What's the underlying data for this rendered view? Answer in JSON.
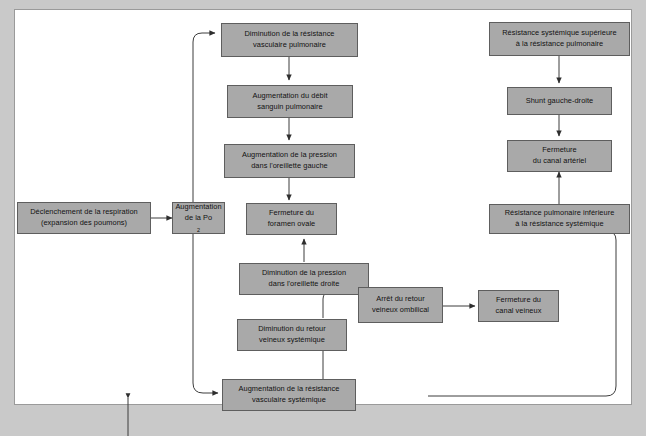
{
  "diagram": {
    "background_color": "#c9c9c9",
    "page_color": "#ffffff",
    "node_fill": "#a9a9a9",
    "node_border": "#5e5e5e",
    "line_color": "#3c3c3c",
    "nodes": [
      {
        "id": "declenchement",
        "line1": "Déclenchement de la respiration",
        "line2": "(expansion des poumons)"
      },
      {
        "id": "augmentation-po2",
        "line1": "Augmentation",
        "line2": "de la Po",
        "sub": "2"
      },
      {
        "id": "diminution-resistance-vasc-pulm",
        "line1": "Diminution de la résistance",
        "line2": "vasculaire pulmonaire"
      },
      {
        "id": "augmentation-debit-sanguin",
        "line1": "Augmentation du débit",
        "line2": "sanguin pulmonaire"
      },
      {
        "id": "augmentation-pression-oreillette-gauche",
        "line1": "Augmentation de la pression",
        "line2": "dans l'oreillette gauche"
      },
      {
        "id": "fermeture-foramen-ovale",
        "line1": "Fermeture du",
        "line2": "foramen ovale"
      },
      {
        "id": "diminution-pression-oreillette-droite",
        "line1": "Diminution de la pression",
        "line2": "dans l'oreillette droite"
      },
      {
        "id": "diminution-retour-veineux",
        "line1": "Diminution du retour",
        "line2": "veineux systémique"
      },
      {
        "id": "augmentation-resistance-vasc-syst",
        "line1": "Augmentation de la résistance",
        "line2": "vasculaire systémique"
      },
      {
        "id": "arret-retour-veineux-ombilical",
        "line1": "Arrêt du retour",
        "line2": "veineux ombilical"
      },
      {
        "id": "fermeture-canal-veineux",
        "line1": "Fermeture du",
        "line2": "canal veineux"
      },
      {
        "id": "resistance-systemique-superieure",
        "line1": "Résistance systémique supérieure",
        "line2": "à la résistance pulmonaire"
      },
      {
        "id": "shunt-gauche-droite",
        "line1": "Shunt gauche-droite",
        "line2": ""
      },
      {
        "id": "fermeture-canal-arteriel",
        "line1": "Fermeture",
        "line2": "du canal artériel"
      },
      {
        "id": "resistance-pulmonaire-inferieure",
        "line1": "Résistance pulmonaire inférieure",
        "line2": "à la résistance systémique"
      }
    ]
  }
}
